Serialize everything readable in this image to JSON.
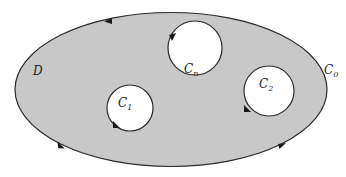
{
  "diagram": {
    "type": "multiply-connected-region",
    "region_label": "D",
    "fill_color": "#c8c8c8",
    "stroke_color": "#2a2a2a",
    "outer_contour": {
      "label_base": "C",
      "label_sub": "0",
      "orientation": "counterclockwise",
      "shape": "ellipse",
      "cx": 171,
      "cy": 89.5,
      "rx": 156,
      "ry": 77
    },
    "inner_contours": [
      {
        "label_base": "C",
        "label_sub": "n",
        "orientation": "clockwise",
        "cx": 195,
        "cy": 48,
        "r": 27
      },
      {
        "label_base": "C",
        "label_sub": "1",
        "orientation": "clockwise",
        "cx": 130,
        "cy": 108,
        "r": 23
      },
      {
        "label_base": "C",
        "label_sub": "2",
        "orientation": "clockwise",
        "cx": 269,
        "cy": 91,
        "r": 25
      }
    ]
  }
}
